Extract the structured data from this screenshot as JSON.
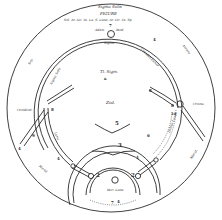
{
  "diagram": {
    "title_lines": [
      "Sigma Solis",
      "FIGURE",
      "Sol. Ar. Hc. Ta. Lu. S. Luna. Ar. Hc. Ta. Sp."
    ],
    "top_node_number": "7",
    "top_node_labels": {
      "left": "Adam",
      "right": "Mod."
    },
    "under_top_label": "Sigma",
    "center_labels": {
      "upper": "Tl. Sigm.",
      "marker": "K",
      "lower": "Zod."
    },
    "arc_labels": {
      "left_outer": "Sep.",
      "left_inner": "Sigma Solis",
      "right_inner": "Circulus Lunae",
      "right_outer": "Aurora",
      "left_side": "Occident.",
      "right_side": "Oriens",
      "lower_left": "Merid.",
      "lower_right": "Merid.",
      "right_band": "Orbita Lunae",
      "inner_left": "Luna",
      "bottom_inner": "Mer. Luna"
    },
    "numbers": {
      "n4_top_right": "4",
      "n8_left": "8",
      "n8_right_upper": "8",
      "n8_right": "8",
      "n9_left": "9",
      "n10_right": "10",
      "n4_left": "4",
      "n4_bottom_left": "4",
      "n5": "5",
      "n6": "6",
      "n3": "3",
      "n1": "1",
      "n2_left": "2",
      "n2_right": "2",
      "n4_bottom": "4",
      "n7_bottom": "7"
    },
    "colors": {
      "ink": "#2a2a2a",
      "paper": "#ffffff"
    }
  }
}
